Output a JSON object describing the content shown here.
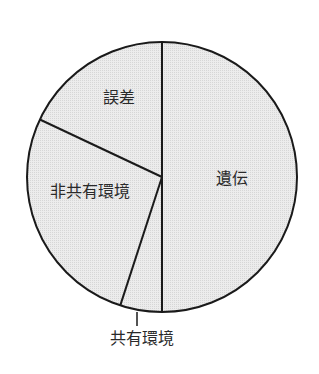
{
  "chart_data": {
    "type": "pie",
    "title": "",
    "start_angle_deg": 0,
    "direction": "clockwise",
    "slices": [
      {
        "label": "遺伝",
        "value": 50
      },
      {
        "label": "共有環境",
        "value": 5
      },
      {
        "label": "非共有環境",
        "value": 27
      },
      {
        "label": "誤差",
        "value": 18
      }
    ],
    "categories": [
      "遺伝",
      "共有環境",
      "非共有環境",
      "誤差"
    ],
    "values": [
      50,
      5,
      27,
      18
    ],
    "legend": "none (labels placed on/near slices)",
    "fill_color": "#e6e6e6",
    "stroke_color": "#1a1a1a"
  },
  "labels": {
    "heredity": "遺伝",
    "shared_env": "共有環境",
    "nonshared_env": "非共有環境",
    "error": "誤差"
  }
}
